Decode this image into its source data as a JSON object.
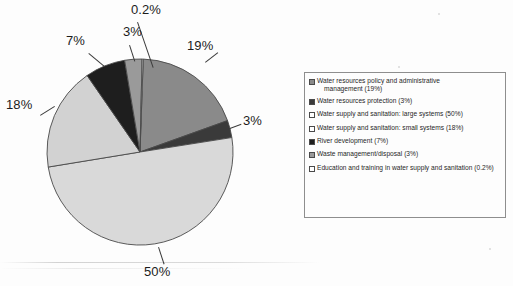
{
  "chart_data": {
    "type": "pie",
    "title": "",
    "xlabel": "",
    "ylabel": "",
    "legend_position": "right",
    "grid": false,
    "start_angle_deg": -88,
    "direction": "clockwise",
    "categories": [
      "Water resources policy and administrative management",
      "Water resources protection",
      "Water supply and sanitation: large systems",
      "Water supply and sanitation: small systems",
      "River development",
      "Waste management/disposal",
      "Education and training in water supply and sanitation"
    ],
    "values": [
      19,
      3,
      50,
      18,
      7,
      3,
      0.2
    ],
    "value_labels": [
      "19%",
      "3%",
      "50%",
      "18%",
      "7%",
      "3%",
      "0.2%"
    ],
    "colors": [
      "#8a8a8a",
      "#3a3a3a",
      "#d9d9d9",
      "#d2d2d2",
      "#1e1e1e",
      "#9a9a9a",
      "#e6e6e6"
    ],
    "slice_border_color": "#4a4a4a"
  },
  "pie": {
    "labels": {
      "s19": "19%",
      "s3a": "3%",
      "s50": "50%",
      "s18": "18%",
      "s7": "7%",
      "s3b": "3%",
      "s02": "0.2%"
    }
  },
  "legend": {
    "items": [
      {
        "swatch_name": "legend-swatch-water-resources-policy",
        "color": "#8a8a8a",
        "line1": "Water resources policy and administrative",
        "line2": "management (19%)",
        "full": "Water resources policy and administrative management (19%)"
      },
      {
        "swatch_name": "legend-swatch-water-resources-protection",
        "color": "#3a3a3a",
        "line1": "Water resources protection (3%)",
        "line2": "",
        "full": "Water resources protection (3%)"
      },
      {
        "swatch_name": "legend-swatch-large-systems",
        "color": "#ffffff",
        "line1": "Water supply and sanitation: large systems (50%)",
        "line2": "",
        "full": "Water supply and sanitation: large systems (50%)"
      },
      {
        "swatch_name": "legend-swatch-small-systems",
        "color": "#ffffff",
        "line1": "Water supply and sanitation: small systems (18%)",
        "line2": "",
        "full": "Water supply and sanitation: small systems (18%)"
      },
      {
        "swatch_name": "legend-swatch-river-development",
        "color": "#1e1e1e",
        "line1": "River development (7%)",
        "line2": "",
        "full": "River development (7%)"
      },
      {
        "swatch_name": "legend-swatch-waste-management",
        "color": "#9a9a9a",
        "line1": "Waste management/disposal (3%)",
        "line2": "",
        "full": "Waste management/disposal (3%)"
      },
      {
        "swatch_name": "legend-swatch-education-training",
        "color": "#ffffff",
        "line1": "Education and training in water supply and sanitation (0.2%)",
        "line2": "",
        "full": "Education and training in water supply and sanitation (0.2%)"
      }
    ]
  }
}
